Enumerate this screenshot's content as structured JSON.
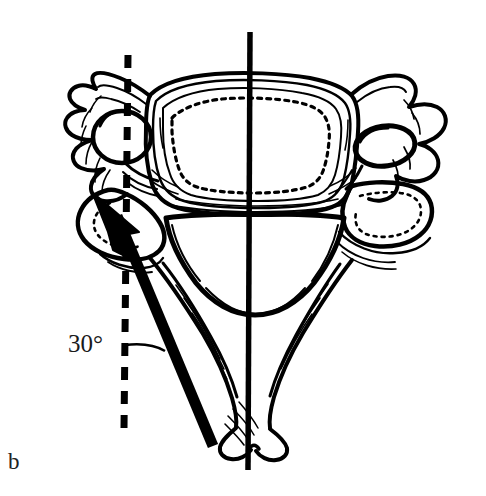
{
  "figure": {
    "panel_label": "b",
    "angle_label": "30°",
    "background_color": "#ffffff",
    "ink_color": "#000000"
  },
  "annotations": {
    "angle_value": "30",
    "angle_unit": "°",
    "angle_text": "30°",
    "reference_line_style": "dashed-vertical",
    "midline_style": "solid-vertical",
    "arrow_description": "bold-insertion-trajectory-arrow"
  },
  "labels": {
    "panel": "b"
  },
  "colors": {
    "ink": "#000000",
    "paper": "#ffffff",
    "text": "#1a1a1a"
  }
}
